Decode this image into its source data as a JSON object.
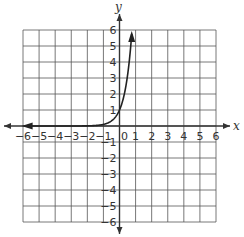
{
  "chart_data": {
    "type": "line",
    "title": "",
    "xlabel": "x",
    "ylabel": "y",
    "xlim": [
      -6,
      6
    ],
    "ylim": [
      -6,
      6
    ],
    "grid": true,
    "x_ticks": [
      "-6",
      "-5",
      "-4",
      "-3",
      "-2",
      "-1",
      "0",
      "1",
      "2",
      "3",
      "4",
      "5",
      "6"
    ],
    "y_ticks": [
      "6",
      "5",
      "4",
      "3",
      "2",
      "1",
      "-1",
      "-2",
      "-3",
      "-4",
      "-5",
      "-6"
    ],
    "series": [
      {
        "name": "exponential curve",
        "x": [
          -6,
          -5,
          -4,
          -3,
          -2,
          -1,
          -0.5,
          0,
          0.3,
          0.5,
          0.7,
          0.78
        ],
        "y": [
          0.0,
          0.0,
          0.0,
          0.0,
          0.01,
          0.1,
          0.32,
          1.0,
          2.0,
          3.16,
          5.0,
          6.0
        ]
      }
    ],
    "annotations": [
      "arrowheads at both ends of curve",
      "arrowheads on both axes"
    ]
  },
  "labels": {
    "x_axis": "x",
    "y_axis": "y",
    "origin": "0"
  },
  "colors": {
    "grid": "#555555",
    "axis": "#333333",
    "curve": "#222222"
  }
}
